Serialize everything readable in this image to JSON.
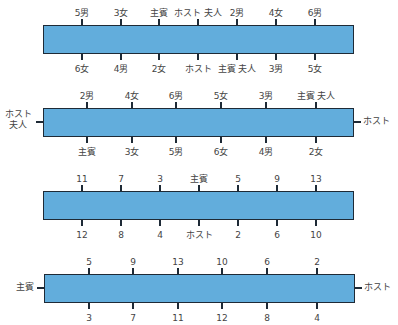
{
  "diagram": {
    "colors": {
      "table_fill": "#62addc",
      "table_border": "#1e2a36",
      "label": "#444444"
    },
    "tables": [
      {
        "id": "table-1",
        "top_seats": [
          "5男",
          "3女",
          "主賓",
          "ホスト 夫人",
          "2男",
          "4女",
          "6男"
        ],
        "bottom_seats": [
          "6女",
          "4男",
          "2女",
          "ホスト",
          "主賓 夫人",
          "3男",
          "5女"
        ],
        "left_end": "",
        "right_end": ""
      },
      {
        "id": "table-2",
        "top_seats": [
          "2男",
          "4女",
          "6男",
          "5女",
          "3男",
          "主賓 夫人"
        ],
        "bottom_seats": [
          "主賓",
          "3女",
          "5男",
          "6女",
          "4男",
          "2女"
        ],
        "left_end": "ホスト 夫人",
        "left_end_lines": [
          "ホスト",
          "夫人"
        ],
        "right_end": "ホスト"
      },
      {
        "id": "table-3",
        "top_seats": [
          "11",
          "7",
          "3",
          "主賓",
          "5",
          "9",
          "13"
        ],
        "bottom_seats": [
          "12",
          "8",
          "4",
          "ホスト",
          "2",
          "6",
          "10"
        ],
        "left_end": "",
        "right_end": ""
      },
      {
        "id": "table-4",
        "top_seats": [
          "5",
          "9",
          "13",
          "10",
          "6",
          "2"
        ],
        "bottom_seats": [
          "3",
          "7",
          "11",
          "12",
          "8",
          "4"
        ],
        "left_end": "主賓",
        "right_end": "ホスト"
      }
    ]
  }
}
